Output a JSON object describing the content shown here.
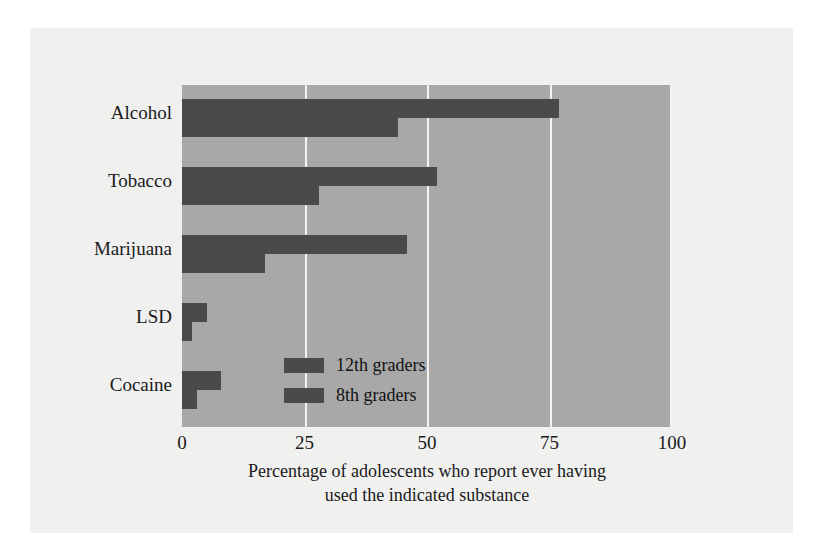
{
  "chart_data": {
    "type": "bar",
    "orientation": "horizontal",
    "title": "",
    "xlabel_line1": "Percentage of adolescents who report ever having",
    "xlabel_line2": "used the indicated substance",
    "ylabel": "",
    "categories": [
      "Alcohol",
      "Tobacco",
      "Marijuana",
      "LSD",
      "Cocaine"
    ],
    "series": [
      {
        "name": "12th graders",
        "values": [
          77,
          52,
          46,
          5,
          8
        ]
      },
      {
        "name": "8th graders",
        "values": [
          44,
          28,
          17,
          2,
          3
        ]
      }
    ],
    "xlim": [
      0,
      100
    ],
    "xticks": [
      0,
      25,
      50,
      75,
      100
    ],
    "xtick_labels": [
      "0",
      "25",
      "50",
      "75",
      "100"
    ],
    "grid": true,
    "legend_position": "inside-center",
    "colors": {
      "bar": "#4a4a4a",
      "plot_background": "#a8a8a8",
      "gridline": "#f2f2f2",
      "page_background": "#f0f0ef",
      "text": "#1a1a1a"
    }
  }
}
